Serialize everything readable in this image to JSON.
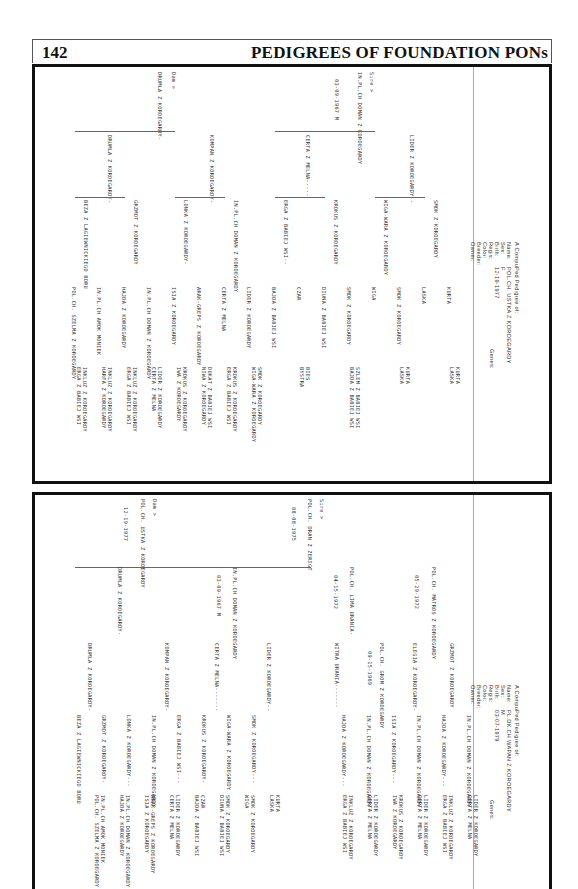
{
  "page": {
    "number": "142",
    "title": "PEDIGREES OF FOUNDATION PONs"
  },
  "pedigree1": {
    "heading": "A CompuPed Pedigree of:",
    "fields": {
      "name_label": "Name:",
      "name": "POL.CH. USTKA Z KOROEGARDY",
      "sex_label": "Sex:",
      "sex": "F",
      "birth_label": "Birth:",
      "birth": "12-19-1977",
      "regis_label": "Regis:",
      "color_label": "Color:",
      "breeder_label": "Breeder:",
      "owner_label": "Owner:",
      "genes_label": "Genes:"
    },
    "sire_label": "Sire >",
    "dam_label": "Dam >",
    "sire": {
      "name": "IN.PL.CH DOMAN Z KOROEGARDY",
      "birth": "03-09-1967 M"
    },
    "dam": {
      "name": "DRUMLA Z KOROEGARDY-"
    },
    "gen2": [
      "LIDER Z KOROEGARDY--",
      "CERTA Z MELNA-----",
      "KOMPAN Z KOROEGARDY-",
      "DRUMLA Z KOROEGARDY-"
    ],
    "gen3": [
      "SMOK Z KOROEGARDY",
      "WIGA-WARA Z KOROEGARDY",
      "KROKUS Z KOROEGARDY",
      "ERGA Z BABIEJ WSI--",
      "IN.PL.CH DOMAN Z KOROEGARDY",
      "LONKA Z KOROEGARDY-",
      "GRZMOT Z KOROEGARDY",
      "BEZA Z LAGIEWNICKIEGO BORU"
    ],
    "gen4": [
      "KURTA",
      "LASKA",
      "SMOK Z KOROEGARDY",
      "WIGA",
      "SMOK Z KOROEGARDY",
      "DIUNA Z BABIEJ WSI",
      "CZAR",
      "BAJDA Z BABIEJ WSI",
      "LIDER Z KOROEGARDY",
      "CERTA Z MELNA",
      "ARAK-GREPS Z KOROEGARDY",
      "ISIA Z KOROEGARDY",
      "IN.PL.CH DOMAN Z KOROEGARDY",
      "HAJDA Z KOROEGARDY",
      "IN.PL.CH AMOK MONIEK",
      "POL.CH. SZELMA Z KOROEGARDY"
    ],
    "gen5": [
      "KURTA",
      "LASKA",
      "KURTA",
      "LASKA",
      "SZLEM Z BABIEJ WSI",
      "BAJDA Z BABIEJ WSI",
      "BIES",
      "BYSTRA",
      "SMOK Z KOROEGARDY",
      "WIGA-WARA Z KOROEGARDY",
      "KROKUS Z KOROEGARDY",
      "ERGA Z BABIEJ WSI",
      "DUKAT Z BABIEJ WSI",
      "NIWA Z KOROEGARDY",
      "KROKUS Z KOROEGARDY",
      "IWA Z KOROEGARDY",
      "LIDER Z KOROEGARDY",
      "CERTA Z MELNA",
      "INKLUZ Z KOROEGARDY",
      "ERGA Z BABIEJ WSI",
      "INKLUZ Z KOROEGARDY",
      "HARFA Z KOROEGARDY",
      "INKLUZ Z KOROEGARDY",
      "ERGA Z BABIEJ WSI"
    ]
  },
  "pedigree2": {
    "heading": "A CompuPed Pedigree of:",
    "fields": {
      "name_label": "Name:",
      "name": "PL.DK.CH WAPAN Z KOROEGARDY",
      "sex_label": "Sex:",
      "sex": "M",
      "birth_label": "Birth:",
      "birth": "03-07-1979",
      "regis_label": "Regis:",
      "color_label": "Color:",
      "breeder_label": "Breeder:",
      "owner_label": "Owner:",
      "genes_label": "Genes:"
    },
    "sire_label": "Sire >",
    "dam_label": "Dam >",
    "sire": {
      "name": "POL.CH. DRAN Z ZERIGT",
      "birth": "08-08-1975"
    },
    "dam": {
      "name": "POL.CH. USTKA Z KOROEGARDY",
      "birth": "12-19-1977"
    },
    "gen2": [
      "POL.CH. MATROS Z KOROEGARDY",
      "05-29-1972",
      "POL.CH. LIMA URANIA-",
      "04-15-1972",
      "IN.PL.CH DOMAN Z KOROEGARDY",
      "03-09-1967 M",
      "DRUMLA Z KOROEGARDY-"
    ],
    "gen3": [
      "GRZMOT Z KOROEGARDY",
      "ELEGIA Z KOROEGARDY-",
      "POL.CH. GROM Z KOROEGARDY",
      "09-15-1969",
      "WITRA URANIA-------",
      "LIDER Z KOROEGARDY--",
      "CERTA Z MELNA-------",
      "KOMPAN Z KOROEGARDY-",
      "DRUMLA Z KOROEGARDY-"
    ],
    "gen4": [
      "IN.PL.CH DOMAN Z KOROEGARDY",
      "HAJDA Z KOROEGARDY---",
      "IN.PL.CH DOMAN Z KOROEGARDY",
      "ISIA Z KOROEGARDY---",
      "IN.PL.CH DOMAN Z KOROEGARDY",
      "HAJDA Z KOROEGARDY---",
      "SMOK Z KOROEGARDY---",
      "WIGA-WARA Z KOROEGARDY",
      "KROKUS Z KOROEGARDY-",
      "ERGA Z BABIEJ WSI---",
      "IN.PL.CH DOMAN Z KOROEGARDY",
      "LONKA Z KOROEGARDY---",
      "GRZMOT Z KOROEGARDY-",
      "BEZA Z LAGIEWNICKIEGO BORU"
    ],
    "gen5": [
      "LIDER Z KOROEGARDY",
      "CERTA Z MELNA",
      "INKLUZ Z KOROEGARDY",
      "ERGA Z BABIEJ WSI",
      "LIDER Z KOROEGARDY",
      "CERTA Z MELNA",
      "KROKUS Z KOROEGARDY",
      "IWA Z KOROEGARDY",
      "LIDER Z KOROEGARDY",
      "CERTA Z MELNA",
      "INKLUZ Z KOROEGARDY",
      "ERGA Z BABIEJ WSI",
      "KURTA",
      "LASKA",
      "SMOK Z KOROEGARDY",
      "WIGA",
      "SMOK Z KOROEGARDY",
      "DIUNA Z BABIEJ WSI",
      "CZAR",
      "BAJDA Z BABIEJ WSI",
      "LIDER Z KOROEGARDY",
      "CERTA Z MELNA",
      "ARAK-GREPS Z KOROEGARDY",
      "ISIA Z KOROEGARDY",
      "IN.PL.CH DOMAN Z KOROEGARDY",
      "HAJDA Z KOROEGARDY",
      "IN.PL.CH AMOK MONIEK",
      "POL.CH. SZELMA Z KOROEGARDY"
    ]
  }
}
